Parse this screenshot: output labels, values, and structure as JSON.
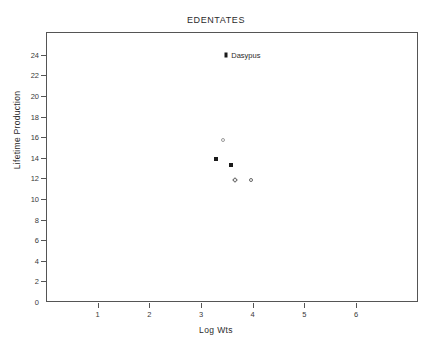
{
  "chart_data": {
    "type": "scatter",
    "title": "EDENTATES",
    "xlabel": "Log Wts",
    "ylabel": "Lifetime Production",
    "xlim": [
      0,
      7.2
    ],
    "ylim": [
      0,
      26.2
    ],
    "xticks": [
      1,
      2,
      3,
      4,
      5,
      6
    ],
    "xtick_labels": [
      "1",
      "2",
      "3",
      "4",
      "5",
      "6"
    ],
    "yticks": [
      0,
      2,
      4,
      6,
      8,
      10,
      12,
      14,
      16,
      18,
      20,
      22,
      24
    ],
    "ytick_labels": [
      "0",
      "2",
      "4",
      "6",
      "8",
      "10",
      "12",
      "14",
      "16",
      "18",
      "20",
      "22",
      "24"
    ],
    "grid": false,
    "legend": "none",
    "points": [
      {
        "x": 3.47,
        "y": 24.1,
        "marker": "filled-marker",
        "label": "Dasypus"
      },
      {
        "x": 3.4,
        "y": 15.8,
        "marker": "open-circle",
        "label": ""
      },
      {
        "x": 3.28,
        "y": 13.95,
        "marker": "filled-square",
        "label": ""
      },
      {
        "x": 3.57,
        "y": 13.4,
        "marker": "filled-square",
        "label": ""
      },
      {
        "x": 3.63,
        "y": 11.95,
        "marker": "open-diamond",
        "label": ""
      },
      {
        "x": 3.95,
        "y": 11.95,
        "marker": "open-circle-dark",
        "label": ""
      }
    ]
  }
}
